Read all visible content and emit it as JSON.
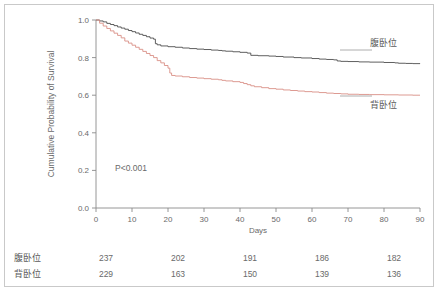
{
  "figure": {
    "pvalue_text": "P<0.001"
  },
  "legend": {
    "prone": "腹卧位",
    "supine": "背卧位"
  },
  "risk_table": {
    "rows": [
      {
        "label": "腹卧位",
        "values": [
          "237",
          "202",
          "191",
          "186",
          "182"
        ]
      },
      {
        "label": "背卧位",
        "values": [
          "229",
          "163",
          "150",
          "139",
          "136"
        ]
      }
    ],
    "at_days": [
      0,
      20,
      40,
      60,
      80
    ]
  },
  "chart_data": {
    "type": "line",
    "title": "",
    "xlabel": "Days",
    "ylabel": "Cumulative Probability of Survival",
    "xlim": [
      0,
      90
    ],
    "ylim": [
      0.0,
      1.0
    ],
    "xticks": [
      0,
      10,
      20,
      30,
      40,
      50,
      60,
      70,
      80,
      90
    ],
    "xticklabels": [
      "0",
      "10",
      "20",
      "30",
      "40",
      "50",
      "60",
      "70",
      "80",
      "90"
    ],
    "yticks": [
      0.0,
      0.2,
      0.4,
      0.6,
      0.8,
      1.0
    ],
    "yticklabels": [
      "0.0",
      "0.2",
      "0.4",
      "0.6",
      "0.8",
      "1.0"
    ],
    "grid": false,
    "legend_position": "right-inline",
    "annotations": [
      {
        "text": "P<0.001",
        "x": 10,
        "y": 0.21
      }
    ],
    "series": [
      {
        "name": "腹卧位",
        "color": "#4d4d4d",
        "step": "post",
        "x": [
          0,
          1,
          2,
          3,
          4,
          5,
          6,
          7,
          8,
          9,
          10,
          11,
          12,
          13,
          14,
          15,
          16,
          16.5,
          17,
          18,
          20,
          22,
          24,
          26,
          28,
          30,
          32,
          34,
          35,
          36,
          38,
          40,
          42,
          43,
          45,
          48,
          50,
          52,
          55,
          57,
          60,
          62,
          64,
          66,
          67,
          68,
          70,
          73,
          76,
          80,
          83,
          84,
          86,
          88,
          90
        ],
        "y": [
          1.0,
          0.995,
          0.99,
          0.982,
          0.976,
          0.97,
          0.963,
          0.957,
          0.951,
          0.944,
          0.938,
          0.931,
          0.924,
          0.918,
          0.911,
          0.904,
          0.898,
          0.874,
          0.868,
          0.862,
          0.858,
          0.855,
          0.851,
          0.848,
          0.845,
          0.843,
          0.84,
          0.838,
          0.836,
          0.834,
          0.831,
          0.828,
          0.824,
          0.812,
          0.81,
          0.808,
          0.806,
          0.803,
          0.8,
          0.798,
          0.795,
          0.792,
          0.79,
          0.788,
          0.782,
          0.78,
          0.779,
          0.777,
          0.776,
          0.774,
          0.772,
          0.77,
          0.769,
          0.768,
          0.767
        ]
      },
      {
        "name": "背卧位",
        "color": "#d98f86",
        "step": "post",
        "x": [
          0,
          1,
          2,
          3,
          4,
          5,
          6,
          7,
          8,
          9,
          10,
          11,
          12,
          13,
          14,
          15,
          16,
          17,
          18,
          19,
          20,
          20.5,
          21,
          22,
          24,
          26,
          28,
          30,
          32,
          34,
          35,
          36,
          38,
          40,
          41,
          42,
          43,
          44,
          46,
          48,
          50,
          52,
          54,
          56,
          58,
          60,
          62,
          64,
          66,
          68,
          70,
          73,
          76,
          80,
          84,
          88,
          90
        ],
        "y": [
          1.0,
          0.983,
          0.968,
          0.955,
          0.942,
          0.93,
          0.918,
          0.905,
          0.888,
          0.877,
          0.866,
          0.855,
          0.844,
          0.833,
          0.822,
          0.811,
          0.8,
          0.784,
          0.772,
          0.758,
          0.744,
          0.718,
          0.705,
          0.702,
          0.698,
          0.694,
          0.691,
          0.688,
          0.685,
          0.682,
          0.679,
          0.676,
          0.672,
          0.668,
          0.662,
          0.656,
          0.65,
          0.645,
          0.64,
          0.635,
          0.632,
          0.628,
          0.625,
          0.622,
          0.619,
          0.617,
          0.614,
          0.611,
          0.609,
          0.607,
          0.605,
          0.604,
          0.603,
          0.602,
          0.601,
          0.6,
          0.6
        ]
      }
    ]
  }
}
